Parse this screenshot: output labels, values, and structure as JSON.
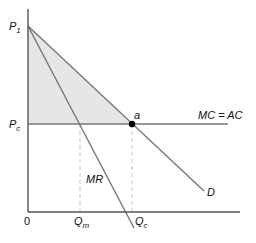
{
  "diagram": {
    "type": "monopoly-deadweight-loss",
    "labels": {
      "p1": "P",
      "p1_sub": "1",
      "pc": "P",
      "pc_sub": "c",
      "origin": "0",
      "qm": "Q",
      "qm_sub": "m",
      "qc": "Q",
      "qc_sub": "c",
      "point_a": "a",
      "mc_ac": "MC = AC",
      "mr": "MR",
      "demand": "D"
    },
    "curves": [
      {
        "name": "D",
        "from": "P1",
        "through": "a",
        "description": "Demand curve"
      },
      {
        "name": "MR",
        "from": "P1",
        "description": "Marginal revenue curve, steeper than demand"
      },
      {
        "name": "MC = AC",
        "level": "Pc",
        "description": "Horizontal marginal/average cost line"
      }
    ],
    "shaded_region": "Triangle between P1, Pc-level and point a (consumer surplus under competition)",
    "colors": {
      "axis": "#555555",
      "curve": "#777777",
      "shade": "#e6e6e6",
      "dashed": "#cfcfcf",
      "point": "#000000"
    }
  }
}
